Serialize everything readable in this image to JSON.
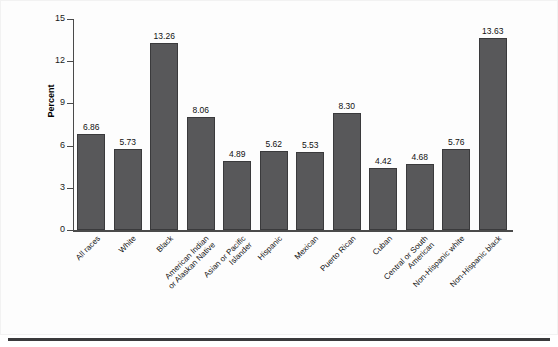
{
  "chart_data": {
    "type": "bar",
    "title": "",
    "xlabel": "",
    "ylabel": "Percent",
    "ylim": [
      0,
      15
    ],
    "yticks": [
      0,
      3,
      6,
      9,
      12,
      15
    ],
    "grid": false,
    "legend": null,
    "bar_color": "#58585a",
    "bar_edge_color": "#3a3a3c",
    "categories": [
      "All races",
      "White",
      "Black",
      "American Indian\nor Alaskan Native",
      "Asian or Pacific\nIslander",
      "Hispanic",
      "Mexican",
      "Puerto Rican",
      "Cuban",
      "Central or South\nAmerican",
      "Non-Hispanic white",
      "Non-Hispanic black"
    ],
    "values": [
      6.86,
      5.73,
      13.26,
      8.06,
      4.89,
      5.62,
      5.53,
      8.3,
      4.42,
      4.68,
      5.76,
      13.63
    ],
    "value_labels": [
      "6.86",
      "5.73",
      "13.26",
      "8.06",
      "4.89",
      "5.62",
      "5.53",
      "8.30",
      "4.42",
      "4.68",
      "5.76",
      "13.63"
    ]
  }
}
